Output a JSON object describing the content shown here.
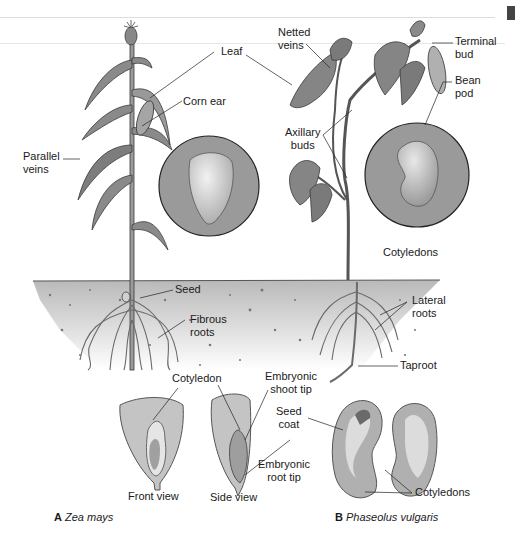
{
  "figure": {
    "panels": [
      {
        "id": "A",
        "letter": "A",
        "species": "Zea mays",
        "labels": {
          "leaf": "Leaf",
          "corn_ear": "Corn ear",
          "parallel_veins": "Parallel\nveins",
          "seed": "Seed",
          "fibrous_roots": "Fibrous\nroots",
          "cotyledon": "Cotyledon",
          "front_view": "Front view",
          "side_view": "Side view"
        }
      },
      {
        "id": "B",
        "letter": "B",
        "species": "Phaseolus vulgaris",
        "labels": {
          "netted_veins": "Netted\nveins",
          "terminal_bud": "Terminal\nbud",
          "bean_pod": "Bean\npod",
          "axillary_buds": "Axillary\nbuds",
          "cotyledons_circle": "Cotyledons",
          "lateral_roots": "Lateral\nroots",
          "taproot": "Taproot",
          "embryonic_shoot_tip": "Embryonic\nshoot tip",
          "seed_coat": "Seed\ncoat",
          "embryonic_root_tip": "Embryonic\nroot tip",
          "cotyledons_seed": "Cotyledons"
        }
      }
    ],
    "colors": {
      "ink": "#1a1a1a",
      "plant_gray": "#8a8a8a",
      "plant_dark": "#4a4a4a",
      "circle_fill": "#9a9a9a",
      "seed_fill": "#c8c8c8",
      "soil_top": "#bdbdbd",
      "soil_bottom": "#f4f4f4"
    }
  }
}
